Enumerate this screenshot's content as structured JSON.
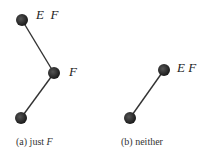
{
  "figures": [
    {
      "id": "a",
      "caption_prefix": "(a) just ",
      "caption_var": "F",
      "nodes": [
        {
          "label": "E  F"
        },
        {
          "label": "F"
        },
        {
          "label": ""
        }
      ]
    },
    {
      "id": "b",
      "caption_prefix": "(b) neither",
      "caption_var": "",
      "nodes": [
        {
          "label": "E F"
        },
        {
          "label": ""
        }
      ]
    }
  ],
  "colors": {
    "node": "#2a2a2a",
    "edge": "#333333"
  }
}
